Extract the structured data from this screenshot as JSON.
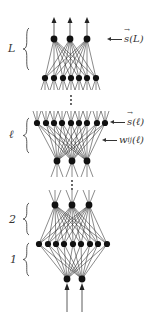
{
  "diagram": {
    "colors": {
      "line": "#2a2a2a",
      "node": "#111111",
      "background": "#ffffff"
    },
    "layers": [
      {
        "id": "out",
        "y": 39,
        "x": [
          54,
          70,
          87
        ]
      },
      {
        "id": "L_in",
        "y": 78,
        "x": [
          45,
          54,
          63,
          71,
          79,
          87,
          96
        ]
      },
      {
        "id": "l_top",
        "y": 123,
        "x": [
          37,
          46,
          54,
          62,
          71,
          79,
          87,
          97,
          105
        ]
      },
      {
        "id": "l_bot",
        "y": 161,
        "x": [
          57,
          72,
          87
        ]
      },
      {
        "id": "h2",
        "y": 205,
        "x": [
          55,
          72,
          89
        ]
      },
      {
        "id": "h1",
        "y": 244,
        "x": [
          39,
          48,
          56,
          64,
          73,
          81,
          90,
          98,
          107
        ]
      },
      {
        "id": "in",
        "y": 279,
        "x": [
          67,
          82
        ]
      }
    ],
    "connections": [
      [
        "out",
        "L_in"
      ],
      [
        "l_top",
        "l_bot"
      ],
      [
        "h2",
        "h1"
      ],
      [
        "h1",
        "in"
      ]
    ],
    "output_arrows": {
      "x": [
        54,
        70,
        87
      ],
      "from_y": 39,
      "to_y": 17
    },
    "input_arrows": {
      "x": [
        67,
        82
      ],
      "from_y": 312,
      "to_y": 279
    },
    "ellipses": [
      {
        "x": 71,
        "y": [
          96,
          100,
          104
        ]
      },
      {
        "x": 72,
        "y": [
          181,
          185,
          189
        ]
      }
    ],
    "brace_labels": [
      {
        "label": "L",
        "y_top": 28,
        "y_bottom": 70
      },
      {
        "label": "ℓ",
        "y_top": 118,
        "y_bottom": 153
      },
      {
        "label": "2",
        "y_top": 203,
        "y_bottom": 235
      },
      {
        "label": "1",
        "y_top": 243,
        "y_bottom": 276
      }
    ],
    "annotations": [
      {
        "name": "s(L)",
        "vector": "s",
        "arg": "(L)",
        "y": 40
      },
      {
        "name": "s(l)",
        "vector": "s",
        "arg": "(ℓ)",
        "y": 123
      },
      {
        "name": "w_ij(l)",
        "base": "w",
        "sub": "ij",
        "arg": "(ℓ)",
        "y": 141
      }
    ]
  }
}
